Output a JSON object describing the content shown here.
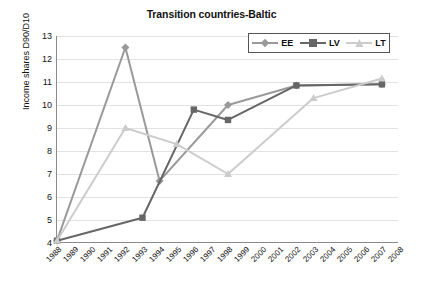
{
  "chart_data": {
    "type": "line",
    "title": "Transition countries-Baltic",
    "xlabel": "",
    "ylabel": "Income shares D90/D10",
    "x": [
      1988,
      1989,
      1990,
      1991,
      1992,
      1993,
      1994,
      1995,
      1996,
      1997,
      1998,
      1999,
      2000,
      2001,
      2002,
      2003,
      2004,
      2005,
      2006,
      2007,
      2008
    ],
    "ylim": [
      4,
      13
    ],
    "yticks": [
      4,
      5,
      6,
      7,
      8,
      9,
      10,
      11,
      12,
      13
    ],
    "grid": true,
    "legend_position": "top-right",
    "series": [
      {
        "name": "EE",
        "color": "#999999",
        "marker": "diamond",
        "points": [
          {
            "x": 1988,
            "y": 4.1
          },
          {
            "x": 1992,
            "y": 12.5
          },
          {
            "x": 1994,
            "y": 6.7
          },
          {
            "x": 1998,
            "y": 10.0
          },
          {
            "x": 2002,
            "y": 10.85
          },
          {
            "x": 2007,
            "y": 10.9
          }
        ]
      },
      {
        "name": "LV",
        "color": "#666666",
        "marker": "square",
        "points": [
          {
            "x": 1988,
            "y": 4.1
          },
          {
            "x": 1993,
            "y": 5.1
          },
          {
            "x": 1996,
            "y": 9.8
          },
          {
            "x": 1998,
            "y": 9.35
          },
          {
            "x": 2002,
            "y": 10.85
          },
          {
            "x": 2007,
            "y": 10.9
          }
        ]
      },
      {
        "name": "LT",
        "color": "#cccccc",
        "marker": "triangle",
        "points": [
          {
            "x": 1988,
            "y": 4.1
          },
          {
            "x": 1992,
            "y": 9.0
          },
          {
            "x": 1995,
            "y": 8.3
          },
          {
            "x": 1998,
            "y": 7.0
          },
          {
            "x": 2003,
            "y": 10.3
          },
          {
            "x": 2007,
            "y": 11.15
          }
        ]
      }
    ]
  }
}
